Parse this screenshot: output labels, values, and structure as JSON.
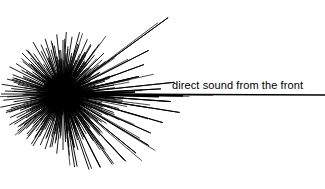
{
  "figure": {
    "title": "",
    "background_color": "#ffffff",
    "ink_color": "#000000",
    "width": 325,
    "height": 189
  },
  "annotations": [
    {
      "name": "direct-sound-label",
      "text": "direct sound from the front",
      "x": 172,
      "y": 79,
      "font_size": 11
    }
  ],
  "chart_data": {
    "type": "scatter",
    "subtype": "polar-hedgehog-reflectogram",
    "title": "",
    "subtitle": "",
    "xlabel": "",
    "ylabel": "",
    "grid": false,
    "legend_position": "none",
    "annotations": [
      "direct sound from the front"
    ],
    "origin": {
      "x": 63,
      "y": 94
    },
    "angle_units": "degrees",
    "angle_convention": "0 deg points right (front); positive counter-clockwise",
    "radius_units": "pixels",
    "direct_sound_ray": {
      "label": "direct sound from the front",
      "angle": 0,
      "radius": 262,
      "line_width": 1.6,
      "end_x": 325,
      "end_y": 95
    },
    "long_rays": [
      {
        "angle": 36,
        "radius": 130
      },
      {
        "angle": 27,
        "radius": 96
      },
      {
        "angle": 20,
        "radius": 86
      },
      {
        "angle": 13,
        "radius": 78
      },
      {
        "angle": 6,
        "radius": 112
      },
      {
        "angle": 3,
        "radius": 98
      },
      {
        "angle": -4,
        "radius": 108
      },
      {
        "angle": -9,
        "radius": 118
      },
      {
        "angle": -16,
        "radius": 104
      },
      {
        "angle": -24,
        "radius": 96
      },
      {
        "angle": -31,
        "radius": 100
      },
      {
        "angle": -39,
        "radius": 94
      },
      {
        "angle": -47,
        "radius": 92
      },
      {
        "angle": -55,
        "radius": 86
      },
      {
        "angle": -63,
        "radius": 82
      },
      {
        "angle": -71,
        "radius": 80
      },
      {
        "angle": -79,
        "radius": 74
      }
    ],
    "rays": [
      {
        "angle": 0,
        "radius": 262
      },
      {
        "angle": 2,
        "radius": 44
      },
      {
        "angle": 3,
        "radius": 98
      },
      {
        "angle": 5,
        "radius": 36
      },
      {
        "angle": 6,
        "radius": 112
      },
      {
        "angle": 8,
        "radius": 30
      },
      {
        "angle": 10,
        "radius": 52
      },
      {
        "angle": 13,
        "radius": 78
      },
      {
        "angle": 15,
        "radius": 34
      },
      {
        "angle": 17,
        "radius": 44
      },
      {
        "angle": 20,
        "radius": 86
      },
      {
        "angle": 22,
        "radius": 38
      },
      {
        "angle": 25,
        "radius": 30
      },
      {
        "angle": 27,
        "radius": 96
      },
      {
        "angle": 30,
        "radius": 42
      },
      {
        "angle": 33,
        "radius": 34
      },
      {
        "angle": 36,
        "radius": 130
      },
      {
        "angle": 39,
        "radius": 46
      },
      {
        "angle": 42,
        "radius": 38
      },
      {
        "angle": 45,
        "radius": 58
      },
      {
        "angle": 48,
        "radius": 32
      },
      {
        "angle": 51,
        "radius": 50
      },
      {
        "angle": 54,
        "radius": 62
      },
      {
        "angle": 57,
        "radius": 40
      },
      {
        "angle": 60,
        "radius": 56
      },
      {
        "angle": 63,
        "radius": 44
      },
      {
        "angle": 66,
        "radius": 60
      },
      {
        "angle": 69,
        "radius": 36
      },
      {
        "angle": 72,
        "radius": 52
      },
      {
        "angle": 75,
        "radius": 64
      },
      {
        "angle": 78,
        "radius": 42
      },
      {
        "angle": 81,
        "radius": 58
      },
      {
        "angle": 84,
        "radius": 48
      },
      {
        "angle": 87,
        "radius": 62
      },
      {
        "angle": 90,
        "radius": 54
      },
      {
        "angle": 93,
        "radius": 44
      },
      {
        "angle": 96,
        "radius": 60
      },
      {
        "angle": 99,
        "radius": 38
      },
      {
        "angle": 102,
        "radius": 52
      },
      {
        "angle": 105,
        "radius": 46
      },
      {
        "angle": 108,
        "radius": 58
      },
      {
        "angle": 111,
        "radius": 40
      },
      {
        "angle": 114,
        "radius": 54
      },
      {
        "angle": 117,
        "radius": 48
      },
      {
        "angle": 120,
        "radius": 60
      },
      {
        "angle": 123,
        "radius": 36
      },
      {
        "angle": 126,
        "radius": 50
      },
      {
        "angle": 129,
        "radius": 56
      },
      {
        "angle": 132,
        "radius": 42
      },
      {
        "angle": 135,
        "radius": 58
      },
      {
        "angle": 138,
        "radius": 46
      },
      {
        "angle": 141,
        "radius": 52
      },
      {
        "angle": 144,
        "radius": 38
      },
      {
        "angle": 147,
        "radius": 56
      },
      {
        "angle": 150,
        "radius": 48
      },
      {
        "angle": 153,
        "radius": 60
      },
      {
        "angle": 156,
        "radius": 44
      },
      {
        "angle": 159,
        "radius": 54
      },
      {
        "angle": 162,
        "radius": 50
      },
      {
        "angle": 165,
        "radius": 58
      },
      {
        "angle": 168,
        "radius": 46
      },
      {
        "angle": 171,
        "radius": 62
      },
      {
        "angle": 174,
        "radius": 52
      },
      {
        "angle": 177,
        "radius": 58
      },
      {
        "angle": 180,
        "radius": 62
      },
      {
        "angle": 183,
        "radius": 56
      },
      {
        "angle": 186,
        "radius": 60
      },
      {
        "angle": 189,
        "radius": 50
      },
      {
        "angle": 192,
        "radius": 64
      },
      {
        "angle": 195,
        "radius": 54
      },
      {
        "angle": 198,
        "radius": 60
      },
      {
        "angle": 201,
        "radius": 46
      },
      {
        "angle": 204,
        "radius": 58
      },
      {
        "angle": 207,
        "radius": 52
      },
      {
        "angle": 210,
        "radius": 62
      },
      {
        "angle": 213,
        "radius": 44
      },
      {
        "angle": 216,
        "radius": 56
      },
      {
        "angle": 219,
        "radius": 50
      },
      {
        "angle": 222,
        "radius": 60
      },
      {
        "angle": 225,
        "radius": 42
      },
      {
        "angle": 228,
        "radius": 54
      },
      {
        "angle": 231,
        "radius": 58
      },
      {
        "angle": 234,
        "radius": 46
      },
      {
        "angle": 237,
        "radius": 52
      },
      {
        "angle": 240,
        "radius": 60
      },
      {
        "angle": 243,
        "radius": 40
      },
      {
        "angle": 246,
        "radius": 56
      },
      {
        "angle": 249,
        "radius": 48
      },
      {
        "angle": 252,
        "radius": 58
      },
      {
        "angle": 255,
        "radius": 44
      },
      {
        "angle": 258,
        "radius": 54
      },
      {
        "angle": 261,
        "radius": 50
      },
      {
        "angle": 264,
        "radius": 60
      },
      {
        "angle": 267,
        "radius": 42
      },
      {
        "angle": 270,
        "radius": 56
      },
      {
        "angle": 273,
        "radius": 48
      },
      {
        "angle": 276,
        "radius": 62
      },
      {
        "angle": 279,
        "radius": 74
      },
      {
        "angle": 282,
        "radius": 52
      },
      {
        "angle": 285,
        "radius": 58
      },
      {
        "angle": 288,
        "radius": 44
      },
      {
        "angle": 291,
        "radius": 80
      },
      {
        "angle": 294,
        "radius": 50
      },
      {
        "angle": 297,
        "radius": 82
      },
      {
        "angle": 300,
        "radius": 46
      },
      {
        "angle": 303,
        "radius": 56
      },
      {
        "angle": 306,
        "radius": 86
      },
      {
        "angle": 309,
        "radius": 42
      },
      {
        "angle": 313,
        "radius": 92
      },
      {
        "angle": 316,
        "radius": 52
      },
      {
        "angle": 321,
        "radius": 94
      },
      {
        "angle": 324,
        "radius": 48
      },
      {
        "angle": 329,
        "radius": 100
      },
      {
        "angle": 332,
        "radius": 44
      },
      {
        "angle": 336,
        "radius": 96
      },
      {
        "angle": 340,
        "radius": 54
      },
      {
        "angle": 344,
        "radius": 104
      },
      {
        "angle": 347,
        "radius": 40
      },
      {
        "angle": 351,
        "radius": 118
      },
      {
        "angle": 354,
        "radius": 60
      },
      {
        "angle": 356,
        "radius": 108
      },
      {
        "angle": 358,
        "radius": 46
      }
    ]
  }
}
